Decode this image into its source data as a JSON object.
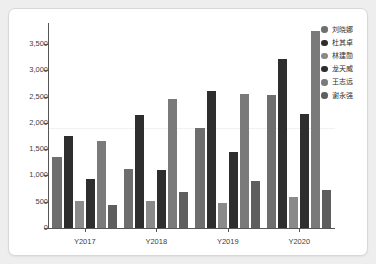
{
  "chart_data": {
    "type": "bar",
    "title": "",
    "xlabel": "",
    "ylabel": "",
    "categories": [
      "Y2017",
      "Y2018",
      "Y2019",
      "Y2020"
    ],
    "ylim": [
      0,
      3900
    ],
    "y_ticks": [
      0,
      500,
      1000,
      1500,
      2000,
      2500,
      3000,
      3500
    ],
    "y_tick_labels": [
      "0",
      "500",
      "1,000",
      "1,500",
      "2,000",
      "2,500",
      "3,000",
      "3,500"
    ],
    "grid": "single faint horizontal line near 1900",
    "legend_position": "right",
    "series": [
      {
        "name": "刘晓娜",
        "color": "#6e6e6e",
        "values": [
          1350,
          1130,
          1905,
          2530
        ]
      },
      {
        "name": "杜其卓",
        "color": "#2e2e2e",
        "values": [
          1750,
          2150,
          2610,
          3215
        ]
      },
      {
        "name": "林建勋",
        "color": "#8a8a8a",
        "values": [
          520,
          515,
          485,
          595
        ]
      },
      {
        "name": "龙天威",
        "color": "#2e2e2e",
        "values": [
          940,
          1100,
          1440,
          2175
        ]
      },
      {
        "name": "王志远",
        "color": "#7a7a7a",
        "values": [
          1660,
          2450,
          2555,
          3745
        ]
      },
      {
        "name": "谢永强",
        "color": "#5e5e5e",
        "values": [
          445,
          685,
          885,
          715
        ]
      }
    ]
  },
  "legend": {
    "items": [
      {
        "label": "刘晓娜",
        "color": "#6e6e6e"
      },
      {
        "label": "杜其卓",
        "color": "#2e2e2e"
      },
      {
        "label": "林建勋",
        "color": "#8a8a8a"
      },
      {
        "label": "龙天威",
        "color": "#2e2e2e"
      },
      {
        "label": "王志远",
        "color": "#7a7a7a"
      },
      {
        "label": "谢永强",
        "color": "#5e5e5e"
      }
    ]
  },
  "axis": {
    "y_tick_labels": [
      "3,500",
      "3,000",
      "2,500",
      "2,000",
      "1,500",
      "1,000",
      "500",
      "0"
    ],
    "x_labels": [
      "Y2017",
      "Y2018",
      "Y2019",
      "Y2020"
    ]
  },
  "theme": {
    "page_background": "#eeeeee",
    "card_background": "#ffffff",
    "card_border": "#d8d8d8",
    "axis_color": "#555555",
    "tick_text": "#404040",
    "gridline": "#f1f1f1"
  }
}
